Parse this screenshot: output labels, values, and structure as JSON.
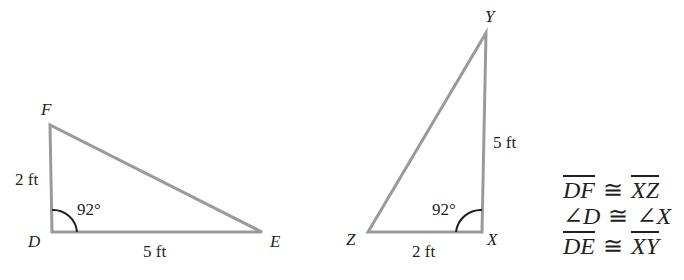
{
  "triangle_def": {
    "vertices": {
      "D": "D",
      "E": "E",
      "F": "F"
    },
    "side_df": "2 ft",
    "side_de": "5 ft",
    "angle_d": "92°"
  },
  "triangle_xyz": {
    "vertices": {
      "X": "X",
      "Y": "Y",
      "Z": "Z"
    },
    "side_xy": "5 ft",
    "side_zx": "2 ft",
    "angle_x": "92°"
  },
  "statements": [
    {
      "left": "DF",
      "symbol": "≅",
      "right": "XZ",
      "kind": "segment"
    },
    {
      "left": "∠D",
      "symbol": "≅",
      "right": "∠X",
      "kind": "angle"
    },
    {
      "left": "DE",
      "symbol": "≅",
      "right": "XY",
      "kind": "segment"
    }
  ],
  "colors": {
    "stroke": "#9a9a9a",
    "text": "#231f20"
  }
}
